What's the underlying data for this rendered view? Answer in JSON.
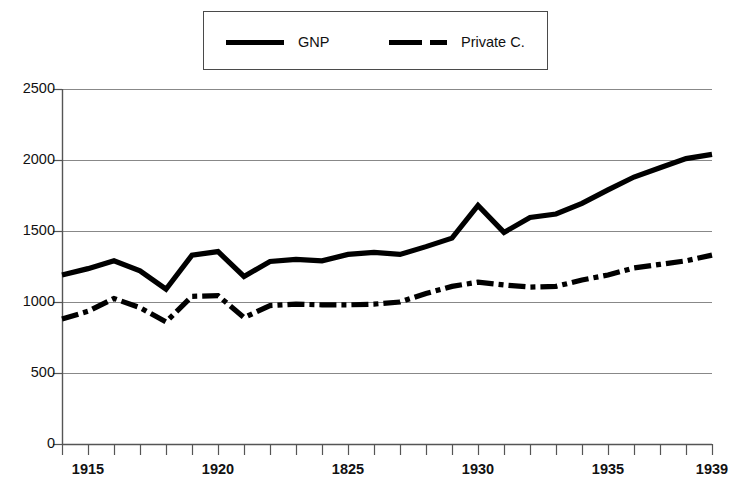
{
  "chart_data": {
    "type": "line",
    "title": "",
    "xlabel": "",
    "ylabel": "",
    "xlim": [
      1914,
      1939
    ],
    "ylim": [
      0,
      2500
    ],
    "grid": true,
    "legend_position": "top-center",
    "y_ticks": [
      2500,
      2000,
      1500,
      1000,
      500,
      0
    ],
    "x_ticks": [
      1914,
      1915,
      1916,
      1917,
      1918,
      1919,
      1920,
      1921,
      1922,
      1923,
      1924,
      1925,
      1926,
      1927,
      1928,
      1929,
      1930,
      1931,
      1932,
      1933,
      1934,
      1935,
      1936,
      1937,
      1938,
      1939
    ],
    "x_tick_labels": [
      {
        "year": 1915,
        "label": "1915"
      },
      {
        "year": 1920,
        "label": "1920"
      },
      {
        "year": 1925,
        "label": "1825"
      },
      {
        "year": 1930,
        "label": "1930"
      },
      {
        "year": 1935,
        "label": "1935"
      },
      {
        "year": 1939,
        "label": "1939"
      }
    ],
    "x": [
      1914,
      1915,
      1916,
      1917,
      1918,
      1919,
      1920,
      1921,
      1922,
      1923,
      1924,
      1925,
      1926,
      1927,
      1928,
      1929,
      1930,
      1931,
      1932,
      1933,
      1934,
      1935,
      1936,
      1937,
      1938,
      1939
    ],
    "series": [
      {
        "name": "GNP",
        "style": "solid",
        "color": "#000000",
        "values": [
          1190,
          1235,
          1290,
          1220,
          1090,
          1330,
          1355,
          1180,
          1285,
          1300,
          1290,
          1335,
          1350,
          1335,
          1390,
          1450,
          1680,
          1490,
          1595,
          1620,
          1695,
          1790,
          1880,
          1945,
          2010,
          2040
        ]
      },
      {
        "name": "Private C.",
        "style": "dash-dot",
        "color": "#000000",
        "values": [
          880,
          935,
          1025,
          960,
          860,
          1040,
          1045,
          890,
          975,
          985,
          980,
          980,
          985,
          1000,
          1060,
          1110,
          1140,
          1120,
          1105,
          1110,
          1155,
          1190,
          1240,
          1265,
          1290,
          1330
        ]
      }
    ]
  },
  "legend": {
    "entries": [
      {
        "label": "GNP",
        "style": "solid"
      },
      {
        "label": "Private C.",
        "style": "dash-dot"
      }
    ]
  },
  "axes": {
    "y_labels": [
      "2500",
      "2000",
      "1500",
      "1000",
      "500",
      "0"
    ]
  }
}
